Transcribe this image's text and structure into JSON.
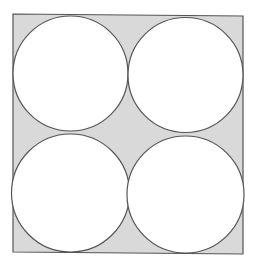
{
  "diagram": {
    "colors": {
      "background": "#ffffff",
      "shaded_region": "#d9d9d9",
      "stroke": "#555555",
      "circle_fill": "#ffffff"
    },
    "square": {
      "points": [
        [
          13,
          14
        ],
        [
          243,
          16
        ],
        [
          243,
          254
        ],
        [
          13,
          252
        ]
      ]
    },
    "circles": [
      {
        "name": "top-left",
        "cx": 70.5,
        "cy": 73.5,
        "r": 57.5
      },
      {
        "name": "top-right",
        "cx": 185.5,
        "cy": 75,
        "r": 57.5
      },
      {
        "name": "bottom-left",
        "cx": 70.5,
        "cy": 193,
        "r": 59
      },
      {
        "name": "bottom-right",
        "cx": 185.5,
        "cy": 194.5,
        "r": 58.5
      }
    ]
  }
}
